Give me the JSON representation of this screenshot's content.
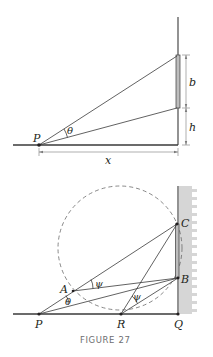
{
  "figure": {
    "caption": "FIGURE 27",
    "top_diagram": {
      "labels": {
        "point_p": "P",
        "angle": "θ",
        "painting_height": "b",
        "eye_offset": "h",
        "distance": "x"
      }
    },
    "bottom_diagram": {
      "labels": {
        "point_p": "P",
        "point_r": "R",
        "point_q": "Q",
        "point_a": "A",
        "point_b": "B",
        "point_c": "C",
        "angle_theta": "θ",
        "angle_psi_a": "ψ",
        "angle_psi_r": "ψ"
      }
    },
    "colors": {
      "line": "#3a3a3a",
      "painting_fill": "#bdbdbd",
      "wall_hatch": "#d6d6d6",
      "caption": "#6d6e71"
    }
  }
}
